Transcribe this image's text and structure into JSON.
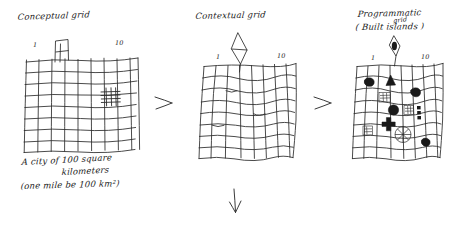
{
  "page": {
    "background": "#ffffff",
    "ink_color": "#1f1f1f",
    "medium": "hand-drawn pencil sketch"
  },
  "panels": [
    {
      "id": "conceptual",
      "title": "Conceptual grid",
      "axis_labels": {
        "left": "1",
        "right": "10"
      },
      "captions": [
        "A city of 100 square",
        "kilometers",
        "(one mile be 100 km²)"
      ],
      "description": "regular hand-ruled grid with a small banner flag on top edge and a dense cross-hatch cell at right"
    },
    {
      "id": "contextual",
      "title": "Contextual grid",
      "axis_labels": {
        "left": "1",
        "right": "10"
      },
      "captions": [],
      "description": "warped irregular grid with a kite/diamond marker above the top edge"
    },
    {
      "id": "programmatic",
      "title": "Programmatic",
      "subtitle": "( Built   islands )",
      "insertion": "grid",
      "axis_labels": {
        "left": "1",
        "right": "10"
      },
      "captions": [],
      "description": "warped grid filled with dark solid blobs, triangles, squares, a cross and a radial circle"
    }
  ],
  "arrows": [
    {
      "name": "arrow-panel1-to-panel2",
      "direction": "right"
    },
    {
      "name": "arrow-panel2-to-panel3",
      "direction": "right"
    },
    {
      "name": "arrow-panel2-down",
      "direction": "down"
    }
  ]
}
